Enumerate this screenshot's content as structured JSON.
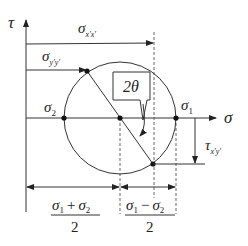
{
  "diagram": {
    "axes": {
      "vertical_label": "τ",
      "horizontal_label": "σ"
    },
    "points": {
      "sigma_1": {
        "label": "σ",
        "subscript": "1"
      },
      "sigma_2": {
        "label": "σ",
        "subscript": "2"
      }
    },
    "annotations": {
      "sigma_xx": {
        "label": "σ",
        "subscript": "x'x'"
      },
      "sigma_yy": {
        "label": "σ",
        "subscript": "y'y'"
      },
      "tau_xy": {
        "label": "τ",
        "subscript": "x'y'"
      },
      "angle": "2θ"
    },
    "dimensions": {
      "center": {
        "numerator_a": "σ",
        "sub_a": "1",
        "op": "+",
        "numerator_b": "σ",
        "sub_b": "2",
        "denominator": "2"
      },
      "radius": {
        "numerator_a": "σ",
        "sub_a": "1",
        "op": "−",
        "numerator_b": "σ",
        "sub_b": "2",
        "denominator": "2"
      }
    }
  }
}
